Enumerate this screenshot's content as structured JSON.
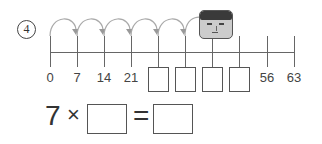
{
  "question": {
    "number": "4"
  },
  "number_line": {
    "step": 7,
    "ticks": [
      {
        "x": 50,
        "label": "0"
      },
      {
        "x": 77,
        "label": "7"
      },
      {
        "x": 104,
        "label": "14"
      },
      {
        "x": 131,
        "label": "21"
      },
      {
        "x": 158,
        "label": ""
      },
      {
        "x": 185,
        "label": ""
      },
      {
        "x": 212,
        "label": ""
      },
      {
        "x": 239,
        "label": ""
      },
      {
        "x": 267,
        "label": "56"
      },
      {
        "x": 294,
        "label": "63"
      }
    ],
    "jumps": 6,
    "answer_boxes": 4
  },
  "equation": {
    "multiplicand": "7",
    "times_sign": "×",
    "equals_sign": "=",
    "factor_box": "",
    "product_box": ""
  },
  "icons": {
    "character": "boy-face-icon",
    "jump_arrow": "curved-arrow-icon"
  }
}
